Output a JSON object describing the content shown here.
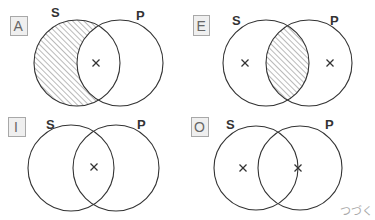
{
  "diagram": {
    "type": "venn-grid",
    "colors": {
      "stroke": "#333333",
      "hatch": "#666666",
      "tag_fill": "#efefef",
      "tag_border": "#a8a8a8",
      "continue_text": "#aaaaaa"
    },
    "panels": [
      {
        "tag": "A",
        "left_label": "S",
        "right_label": "P",
        "shaded": "S-only",
        "crosses": [
          "intersection"
        ]
      },
      {
        "tag": "E",
        "left_label": "S",
        "right_label": "P",
        "shaded": "intersection",
        "crosses": [
          "S-only",
          "P-only"
        ]
      },
      {
        "tag": "I",
        "left_label": "S",
        "right_label": "P",
        "shaded": "none",
        "crosses": [
          "intersection"
        ]
      },
      {
        "tag": "O",
        "left_label": "S",
        "right_label": "P",
        "shaded": "none",
        "crosses": [
          "S-only",
          "on-S-boundary"
        ]
      }
    ],
    "cross_symbol": "×",
    "continue_label": "つづく"
  }
}
